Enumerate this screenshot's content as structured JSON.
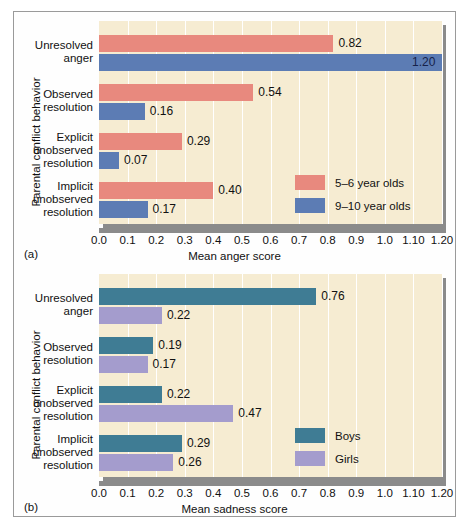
{
  "figure": {
    "panel_a_tag": "(a)",
    "panel_b_tag": "(b)"
  },
  "colors": {
    "plot_background": "#f6ecd2",
    "gridline": "#ffffff",
    "axis_shadow": "#8b8b8b",
    "salmon": "#e8897e",
    "blue": "#5c7cb4",
    "teal": "#3f7c94",
    "purple": "#a49ccd",
    "frame": "#9a9a9a"
  },
  "chart_data": [
    {
      "type": "bar",
      "orientation": "horizontal",
      "panel": "(a)",
      "title": "",
      "xlabel": "Mean anger score",
      "ylabel": "Parental conflict behavior",
      "xlim": [
        0,
        1.2
      ],
      "grid": true,
      "legend_position": "inside-bottom-right",
      "tick_labels": [
        "0.0",
        "0.1",
        "0.2",
        "0.3",
        "0.4",
        "0.5",
        "0.6",
        "0.7",
        "0.8",
        "0.9",
        "1.0",
        "1.10",
        "1.20"
      ],
      "tick_values": [
        0.0,
        0.1,
        0.2,
        0.3,
        0.4,
        0.5,
        0.6,
        0.7,
        0.8,
        0.9,
        1.0,
        1.1,
        1.2
      ],
      "categories": [
        "Unresolved\nanger",
        "Observed\nresolution",
        "Explicit\nunobserved\nresolution",
        "Implicit\nunobserved\nresolution"
      ],
      "category_lines": [
        [
          "Unresolved",
          "anger"
        ],
        [
          "Observed",
          "resolution"
        ],
        [
          "Explicit",
          "unobserved",
          "resolution"
        ],
        [
          "Implicit",
          "unobserved",
          "resolution"
        ]
      ],
      "series": [
        {
          "name": "5–6 year olds",
          "color": "#e8897e",
          "values": [
            0.82,
            0.54,
            0.29,
            0.4
          ],
          "labels": [
            "0.82",
            "0.54",
            "0.29",
            "0.40"
          ]
        },
        {
          "name": "9–10 year olds",
          "color": "#5c7cb4",
          "values": [
            1.2,
            0.16,
            0.07,
            0.17
          ],
          "labels": [
            "1.20",
            "0.16",
            "0.07",
            "0.17"
          ]
        }
      ]
    },
    {
      "type": "bar",
      "orientation": "horizontal",
      "panel": "(b)",
      "title": "",
      "xlabel": "Mean sadness score",
      "ylabel": "Parental conflict behavior",
      "xlim": [
        0,
        1.2
      ],
      "grid": true,
      "legend_position": "inside-bottom-right",
      "tick_labels": [
        "0.0",
        "0.1",
        "0.2",
        "0.3",
        "0.4",
        "0.5",
        "0.6",
        "0.7",
        "0.8",
        "0.9",
        "1.0",
        "1.10",
        "1.20"
      ],
      "tick_values": [
        0.0,
        0.1,
        0.2,
        0.3,
        0.4,
        0.5,
        0.6,
        0.7,
        0.8,
        0.9,
        1.0,
        1.1,
        1.2
      ],
      "categories": [
        "Unresolved\nanger",
        "Observed\nresolution",
        "Explicit\nunobserved\nresolution",
        "Implicit\nunobserved\nresolution"
      ],
      "category_lines": [
        [
          "Unresolved",
          "anger"
        ],
        [
          "Observed",
          "resolution"
        ],
        [
          "Explicit",
          "unobserved",
          "resolution"
        ],
        [
          "Implicit",
          "unobserved",
          "resolution"
        ]
      ],
      "series": [
        {
          "name": "Boys",
          "color": "#3f7c94",
          "values": [
            0.76,
            0.19,
            0.22,
            0.29
          ],
          "labels": [
            "0.76",
            "0.19",
            "0.22",
            "0.29"
          ]
        },
        {
          "name": "Girls",
          "color": "#a49ccd",
          "values": [
            0.22,
            0.17,
            0.47,
            0.26
          ],
          "labels": [
            "0.22",
            "0.17",
            "0.47",
            "0.26"
          ]
        }
      ]
    }
  ]
}
